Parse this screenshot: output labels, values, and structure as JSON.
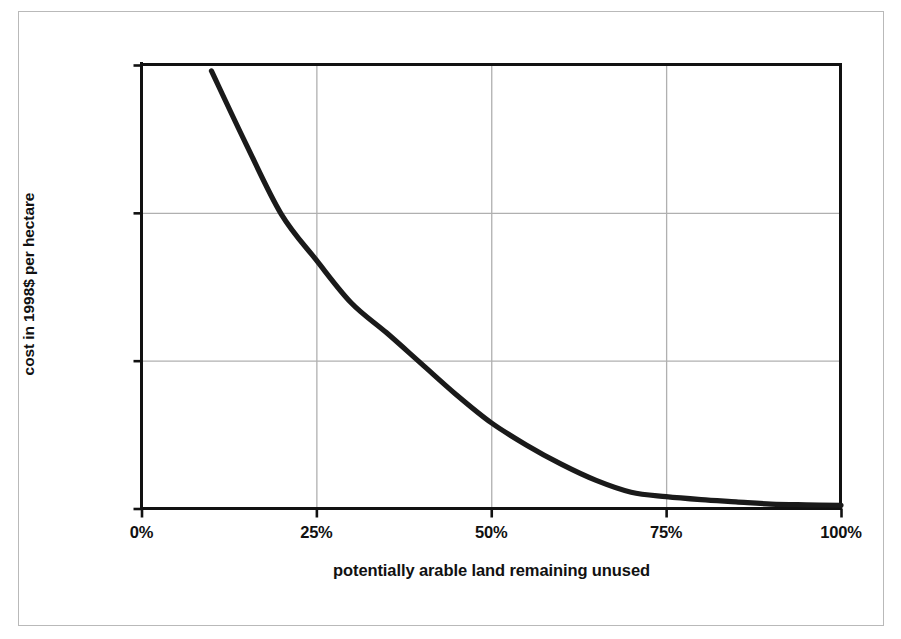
{
  "figure": {
    "background_color": "#ffffff",
    "frame_color": "#b9b9b9",
    "line_color": "#1a1a1a",
    "gridline_color": "#b0b0b0",
    "axis_color": "#111111"
  },
  "chart_data": {
    "type": "line",
    "title": "",
    "xlabel": "potentially arable land remaining unused",
    "ylabel": "cost in 1998$ per hectare",
    "xlim": [
      0,
      100
    ],
    "ylim": [
      0,
      30000
    ],
    "grid": true,
    "legend": "none",
    "x_tick_labels": [
      "0%",
      "25%",
      "50%",
      "75%",
      "100%"
    ],
    "x_ticks": [
      0,
      25,
      50,
      75,
      100
    ],
    "y_tick_labels": [
      "0",
      "10,000",
      "20,000",
      "30,000"
    ],
    "y_ticks": [
      0,
      10000,
      20000,
      30000
    ],
    "series": [
      {
        "name": "cost of conversion",
        "x": [
          10,
          15,
          20,
          25,
          30,
          35,
          40,
          45,
          50,
          55,
          60,
          65,
          70,
          75,
          80,
          85,
          90,
          95,
          100
        ],
        "values": [
          29600,
          24600,
          19900,
          16800,
          13900,
          11900,
          9800,
          7700,
          5800,
          4300,
          3000,
          1900,
          1100,
          800,
          600,
          450,
          300,
          250,
          220
        ]
      }
    ]
  },
  "axes": {
    "y_title": "cost in 1998$ per hectare",
    "x_title": "potentially arable land remaining unused",
    "y_labels": [
      {
        "text": "30,000",
        "value": 30000
      },
      {
        "text": "20,000",
        "value": 20000
      },
      {
        "text": "10,000",
        "value": 10000
      },
      {
        "text": "0",
        "value": 0
      }
    ],
    "x_labels": [
      {
        "text": "0%",
        "value": 0
      },
      {
        "text": "25%",
        "value": 25
      },
      {
        "text": "50%",
        "value": 50
      },
      {
        "text": "75%",
        "value": 75
      },
      {
        "text": "100%",
        "value": 100
      }
    ]
  }
}
